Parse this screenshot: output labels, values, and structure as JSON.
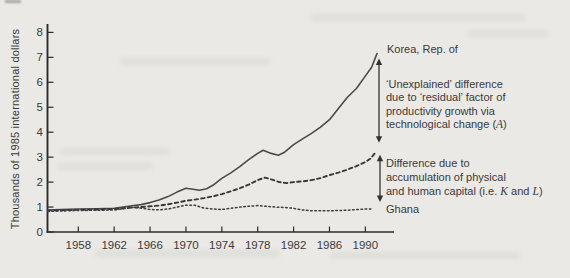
{
  "chart_data": {
    "type": "line",
    "title": "",
    "ylabel": "Thousands of 1985 international dollars",
    "xlabel": "",
    "ylim": [
      0,
      8
    ],
    "xlim": [
      1954.6,
      1993.2
    ],
    "grid": false,
    "legend_position": "right-annotations",
    "yticks": [
      0,
      1,
      2,
      3,
      4,
      5,
      6,
      7,
      8
    ],
    "xticks": [
      1958,
      1962,
      1966,
      1970,
      1974,
      1978,
      1982,
      1986,
      1990
    ],
    "series": [
      {
        "name": "Korea, Rep. of",
        "style": "solid",
        "points": [
          [
            1954.6,
            0.88
          ],
          [
            1956,
            0.9
          ],
          [
            1958,
            0.92
          ],
          [
            1960,
            0.93
          ],
          [
            1962,
            0.95
          ],
          [
            1963,
            1.0
          ],
          [
            1964,
            1.05
          ],
          [
            1965,
            1.1
          ],
          [
            1966,
            1.18
          ],
          [
            1967,
            1.28
          ],
          [
            1968,
            1.42
          ],
          [
            1969,
            1.6
          ],
          [
            1970,
            1.75
          ],
          [
            1970.8,
            1.71
          ],
          [
            1971.5,
            1.67
          ],
          [
            1972.3,
            1.73
          ],
          [
            1973,
            1.87
          ],
          [
            1974,
            2.15
          ],
          [
            1975,
            2.37
          ],
          [
            1976,
            2.62
          ],
          [
            1977,
            2.9
          ],
          [
            1978,
            3.15
          ],
          [
            1978.6,
            3.28
          ],
          [
            1979.5,
            3.15
          ],
          [
            1980.3,
            3.08
          ],
          [
            1981,
            3.2
          ],
          [
            1982,
            3.5
          ],
          [
            1983,
            3.73
          ],
          [
            1984,
            3.95
          ],
          [
            1985,
            4.2
          ],
          [
            1986,
            4.5
          ],
          [
            1987,
            4.95
          ],
          [
            1988,
            5.4
          ],
          [
            1989,
            5.75
          ],
          [
            1990,
            6.25
          ],
          [
            1990.7,
            6.6
          ],
          [
            1991.3,
            7.15
          ]
        ]
      },
      {
        "name": "Korea counterfactual (factor accumulation only)",
        "style": "dashed",
        "points": [
          [
            1954.6,
            0.86
          ],
          [
            1957,
            0.88
          ],
          [
            1960,
            0.9
          ],
          [
            1962,
            0.92
          ],
          [
            1963,
            0.95
          ],
          [
            1964,
            0.98
          ],
          [
            1965,
            1.0
          ],
          [
            1966,
            1.03
          ],
          [
            1967,
            1.06
          ],
          [
            1968,
            1.11
          ],
          [
            1969,
            1.18
          ],
          [
            1970,
            1.25
          ],
          [
            1971,
            1.3
          ],
          [
            1972,
            1.36
          ],
          [
            1973,
            1.43
          ],
          [
            1974,
            1.52
          ],
          [
            1975,
            1.63
          ],
          [
            1976,
            1.75
          ],
          [
            1977,
            1.9
          ],
          [
            1978,
            2.08
          ],
          [
            1978.8,
            2.18
          ],
          [
            1979.6,
            2.1
          ],
          [
            1980.4,
            2.0
          ],
          [
            1981.2,
            1.96
          ],
          [
            1982,
            2.0
          ],
          [
            1983,
            2.03
          ],
          [
            1984,
            2.08
          ],
          [
            1985,
            2.16
          ],
          [
            1986,
            2.28
          ],
          [
            1987,
            2.38
          ],
          [
            1988,
            2.5
          ],
          [
            1989,
            2.64
          ],
          [
            1990,
            2.8
          ],
          [
            1990.6,
            2.95
          ],
          [
            1991.2,
            3.22
          ]
        ]
      },
      {
        "name": "Ghana",
        "style": "dotted",
        "points": [
          [
            1954.6,
            0.82
          ],
          [
            1956,
            0.84
          ],
          [
            1958,
            0.86
          ],
          [
            1960,
            0.87
          ],
          [
            1962,
            0.88
          ],
          [
            1963,
            0.93
          ],
          [
            1964,
            0.98
          ],
          [
            1964.8,
            0.97
          ],
          [
            1966,
            0.9
          ],
          [
            1967,
            0.89
          ],
          [
            1968,
            0.92
          ],
          [
            1969,
            1.0
          ],
          [
            1970,
            1.08
          ],
          [
            1971,
            1.07
          ],
          [
            1972,
            0.96
          ],
          [
            1973,
            0.92
          ],
          [
            1974,
            0.9
          ],
          [
            1975,
            0.95
          ],
          [
            1976,
            1.0
          ],
          [
            1977,
            1.03
          ],
          [
            1978,
            1.06
          ],
          [
            1979,
            1.03
          ],
          [
            1980,
            1.0
          ],
          [
            1981,
            0.98
          ],
          [
            1982,
            0.95
          ],
          [
            1983,
            0.88
          ],
          [
            1984,
            0.85
          ],
          [
            1985,
            0.85
          ],
          [
            1986,
            0.85
          ],
          [
            1987,
            0.86
          ],
          [
            1988,
            0.87
          ],
          [
            1989,
            0.9
          ],
          [
            1990.2,
            0.92
          ],
          [
            1990.9,
            0.92
          ]
        ]
      }
    ],
    "annotations": {
      "korea_label": "Korea, Rep. of",
      "ghana_label": "Ghana",
      "unexplained": [
        [
          {
            "t": "‘Unexplained’ difference"
          }
        ],
        [
          {
            "t": "due to ‘residual’ factor of"
          }
        ],
        [
          {
            "t": "productivity growth via"
          }
        ],
        [
          {
            "t": "technological change ("
          },
          {
            "t": "A",
            "i": true
          },
          {
            "t": ")"
          }
        ]
      ],
      "difference": [
        [
          {
            "t": "Difference due to"
          }
        ],
        [
          {
            "t": "accumulation of physical"
          }
        ],
        [
          {
            "t": "and human capital (i.e. "
          },
          {
            "t": "K",
            "i": true
          },
          {
            "t": " and "
          },
          {
            "t": "L",
            "i": true
          },
          {
            "t": ")"
          }
        ]
      ]
    },
    "colors": {
      "background": "#eae9e5",
      "axis": "#2b2b2b",
      "line_solid": "#4a4a4a",
      "line_dashed": "#383838",
      "line_dotted": "#3f3f3f",
      "text": "#3b3b3b",
      "arrow": "#333333"
    }
  }
}
